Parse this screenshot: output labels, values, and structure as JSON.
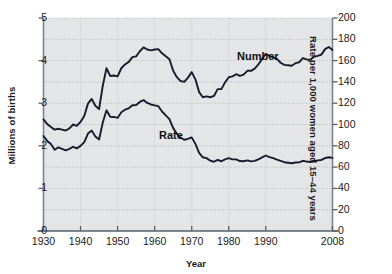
{
  "chart_data": {
    "type": "line",
    "title": "",
    "xlabel": "Year",
    "ylabel": "Millions of births",
    "ylabel_right": "Rate per 1,000 women aged 15–44 years",
    "xlim": [
      1930,
      2008
    ],
    "ylim": [
      0,
      5
    ],
    "ylim_right": [
      0,
      200
    ],
    "grid": true,
    "legend_position": "inline-annotation",
    "plot_bgcolor": "#e3e5e7",
    "line_color": "#1a1a2e",
    "gridline_color": "#9aa3ad",
    "xticks": [
      1930,
      1940,
      1950,
      1960,
      1970,
      1980,
      1990,
      2008
    ],
    "xtick_labels": [
      "1930",
      "1940",
      "1950",
      "1960",
      "1970",
      "1980",
      "1990",
      "2008"
    ],
    "yticks_left": [
      0,
      1,
      2,
      3,
      4,
      5
    ],
    "ytick_labels_left": [
      "0",
      "1",
      "2",
      "3",
      "4",
      "5"
    ],
    "yticks_right": [
      0,
      20,
      40,
      60,
      80,
      100,
      120,
      140,
      160,
      180,
      200
    ],
    "ytick_labels_right": [
      "0",
      "20",
      "40",
      "60",
      "80",
      "100",
      "120",
      "140",
      "160",
      "180",
      "200"
    ],
    "minor_gridlines_left": [
      0.5,
      1.5,
      2.5,
      3.5,
      4.5
    ],
    "series": [
      {
        "name": "Number",
        "label": "Number",
        "axis": "left",
        "units": "millions of births",
        "x": [
          1930,
          1931,
          1932,
          1933,
          1934,
          1935,
          1936,
          1937,
          1938,
          1939,
          1940,
          1941,
          1942,
          1943,
          1944,
          1945,
          1946,
          1947,
          1948,
          1949,
          1950,
          1951,
          1952,
          1953,
          1954,
          1955,
          1956,
          1957,
          1958,
          1959,
          1960,
          1961,
          1962,
          1963,
          1964,
          1965,
          1966,
          1967,
          1968,
          1969,
          1970,
          1971,
          1972,
          1973,
          1974,
          1975,
          1976,
          1977,
          1978,
          1979,
          1980,
          1981,
          1982,
          1983,
          1984,
          1985,
          1986,
          1987,
          1988,
          1989,
          1990,
          1991,
          1992,
          1993,
          1994,
          1995,
          1996,
          1997,
          1998,
          1999,
          2000,
          2001,
          2002,
          2003,
          2004,
          2005,
          2006,
          2007,
          2008
        ],
        "y": [
          2.62,
          2.51,
          2.44,
          2.38,
          2.4,
          2.38,
          2.36,
          2.41,
          2.5,
          2.47,
          2.56,
          2.7,
          2.99,
          3.1,
          2.94,
          2.86,
          3.41,
          3.82,
          3.64,
          3.65,
          3.63,
          3.82,
          3.91,
          3.97,
          4.08,
          4.1,
          4.22,
          4.31,
          4.26,
          4.24,
          4.26,
          4.27,
          4.17,
          4.1,
          4.03,
          3.76,
          3.61,
          3.52,
          3.5,
          3.6,
          3.73,
          3.56,
          3.26,
          3.14,
          3.16,
          3.14,
          3.17,
          3.33,
          3.33,
          3.49,
          3.61,
          3.63,
          3.68,
          3.64,
          3.67,
          3.76,
          3.76,
          3.81,
          3.91,
          4.04,
          4.16,
          4.11,
          4.07,
          4.04,
          3.95,
          3.9,
          3.89,
          3.88,
          3.94,
          3.96,
          4.06,
          4.03,
          4.02,
          4.09,
          4.11,
          4.14,
          4.27,
          4.32,
          4.25
        ],
        "annotation": {
          "text": "Number",
          "x_px": 237,
          "y_px": 50
        }
      },
      {
        "name": "Rate",
        "label": "Rate",
        "axis": "right",
        "units": "rate per 1,000 women aged 15–44 years",
        "x": [
          1930,
          1931,
          1932,
          1933,
          1934,
          1935,
          1936,
          1937,
          1938,
          1939,
          1940,
          1941,
          1942,
          1943,
          1944,
          1945,
          1946,
          1947,
          1948,
          1949,
          1950,
          1951,
          1952,
          1953,
          1954,
          1955,
          1956,
          1957,
          1958,
          1959,
          1960,
          1961,
          1962,
          1963,
          1964,
          1965,
          1966,
          1967,
          1968,
          1969,
          1970,
          1971,
          1972,
          1973,
          1974,
          1975,
          1976,
          1977,
          1978,
          1979,
          1980,
          1981,
          1982,
          1983,
          1984,
          1985,
          1986,
          1987,
          1988,
          1989,
          1990,
          1991,
          1992,
          1993,
          1994,
          1995,
          1996,
          1997,
          1998,
          1999,
          2000,
          2001,
          2002,
          2003,
          2004,
          2005,
          2006,
          2007,
          2008
        ],
        "y": [
          89.2,
          84.6,
          81.7,
          76.3,
          78.5,
          77.2,
          75.8,
          77.1,
          79.1,
          77.6,
          79.9,
          83.4,
          91.5,
          94.3,
          88.8,
          85.9,
          101.9,
          113.3,
          107.3,
          107.1,
          106.2,
          111.5,
          113.9,
          115.2,
          118.1,
          118.3,
          121.2,
          122.9,
          120.2,
          118.8,
          118.0,
          117.2,
          112.2,
          108.5,
          105.0,
          96.6,
          91.3,
          87.6,
          85.7,
          86.5,
          87.9,
          81.8,
          73.4,
          69.2,
          68.4,
          66.0,
          65.0,
          66.8,
          65.5,
          67.2,
          68.4,
          67.3,
          67.3,
          65.7,
          65.5,
          66.3,
          65.4,
          65.8,
          67.3,
          69.2,
          70.9,
          69.3,
          68.4,
          67.0,
          65.9,
          64.6,
          64.1,
          63.6,
          64.3,
          64.4,
          65.9,
          65.3,
          64.8,
          66.1,
          66.3,
          66.7,
          68.5,
          69.3,
          68.7
        ],
        "annotation": {
          "text": "Rate",
          "x_px": 159,
          "y_px": 129
        }
      }
    ]
  },
  "axes": {
    "left_title": "Millions of births",
    "right_title": "Rate per 1,000 women aged 15–44 years",
    "x_title": "Year"
  }
}
